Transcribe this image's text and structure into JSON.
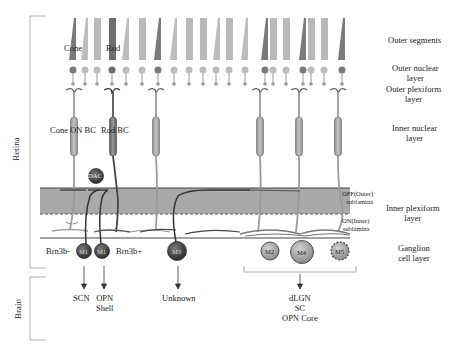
{
  "figure": {
    "regions": {
      "retina": "Retina",
      "brain": "Brain"
    },
    "layers": {
      "outer_segments": "Outer segments",
      "outer_nuclear_1": "Outer nuclear",
      "outer_nuclear_2": "layer",
      "outer_plexiform_1": "Outer plexiform",
      "outer_plexiform_2": "layer",
      "inner_nuclear_1": "Inner nuclear",
      "inner_nuclear_2": "layer",
      "inner_plexiform_1": "Inner plexiform",
      "inner_plexiform_2": "layer",
      "ganglion_1": "Ganglion",
      "ganglion_2": "cell layer"
    },
    "sublamina": {
      "off_1": "OFF(Outer)",
      "off_2": "sublamina",
      "on_1": "ON(Inner)",
      "on_2": "sublamina"
    },
    "photoreceptors": {
      "cone": "Cone",
      "rod": "Rod"
    },
    "bipolar_cells": {
      "cone_on_bc": "Cone ON BC",
      "rod_bc": "Rod BC"
    },
    "amacrine": {
      "dac": "DAC"
    },
    "ganglion_cells": [
      {
        "id": "M1a",
        "label": "M1",
        "marker": "Brn3b-"
      },
      {
        "id": "M1b",
        "label": "M1",
        "marker": "Brn3b+"
      },
      {
        "id": "M3",
        "label": "M3"
      },
      {
        "id": "M2",
        "label": "M2"
      },
      {
        "id": "M4",
        "label": "M4"
      },
      {
        "id": "M5",
        "label": "M5"
      }
    ],
    "markers": {
      "brn3b_neg": "Brn3b-",
      "brn3b_pos": "Brn3b+"
    },
    "targets": {
      "scn": "SCN",
      "opn_shell_1": "OPN",
      "opn_shell_2": "Shell",
      "unknown": "Unknown",
      "group_1": "dLGN",
      "group_2": "SC",
      "group_3": "OPN Core"
    },
    "colors": {
      "ipl_band": "#a9a9a9",
      "cone_dark": "#7a7a7a",
      "cone_light": "#bdbdbd",
      "rod": "#b9b9b9",
      "rod_dark": "#6e6e6e",
      "bipolar": "#a8a8a8",
      "m1_cell": "#4a4a4a",
      "m3_cell": "#5a5a5a",
      "m2_m4_m5_cell": "#a9a9a9",
      "dac_cell": "#555555",
      "bracket": "#999999"
    }
  }
}
